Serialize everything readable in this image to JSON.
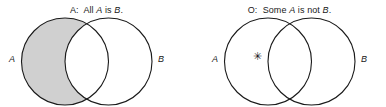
{
  "figure": {
    "background_color": "#ffffff",
    "stroke_color": "#1a1a1a",
    "shade_color": "#d0d0d0"
  },
  "panels": [
    {
      "id": "A",
      "caption_prefix": "A:",
      "caption_text_1": "All ",
      "caption_var_1": "A",
      "caption_text_2": " is ",
      "caption_var_2": "B",
      "caption_text_3": ".",
      "left_circle_label": "A",
      "right_circle_label": "B",
      "shaded_region": "A-only",
      "mark": ""
    },
    {
      "id": "O",
      "caption_prefix": "O:",
      "caption_text_1": "Some ",
      "caption_var_1": "A",
      "caption_text_2": " is not ",
      "caption_var_2": "B",
      "caption_text_3": ".",
      "left_circle_label": "A",
      "right_circle_label": "B",
      "shaded_region": "none",
      "mark": "✳"
    }
  ]
}
